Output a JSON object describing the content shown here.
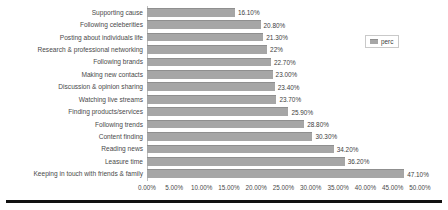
{
  "chart_data": {
    "type": "bar",
    "orientation": "horizontal",
    "title": "",
    "xlabel": "",
    "ylabel": "",
    "xlim": [
      0,
      50
    ],
    "grid": false,
    "legend": {
      "position": "top-right",
      "entries": [
        "perc"
      ]
    },
    "series": [
      {
        "name": "perc",
        "color": "#a6a6a6"
      }
    ],
    "categories": [
      "Supporting cause",
      "Following celeberities",
      "Posting about individuals life",
      "Research & professional networking",
      "Following brands",
      "Making new contacts",
      "Discussion & opinion sharing",
      "Watching live streams",
      "Finding products/services",
      "Following trends",
      "Content finding",
      "Reading news",
      "Leasure time",
      "Keeping in touch with friends & family"
    ],
    "values": [
      16.1,
      20.8,
      21.3,
      22.0,
      22.7,
      23.0,
      23.4,
      23.7,
      25.9,
      28.8,
      30.3,
      34.2,
      36.2,
      47.1
    ],
    "data_labels": [
      "16.10%",
      "20.80%",
      "21.30%",
      "22%",
      "22.70%",
      "23.00%",
      "23.40%",
      "23.70%",
      "25.90%",
      "28.80%",
      "30.30%",
      "34.20%",
      "36.20%",
      "47.10%"
    ],
    "xticks": [
      0,
      5,
      10,
      15,
      20,
      25,
      30,
      35,
      40,
      45,
      50
    ],
    "xticklabels": [
      "0.00%",
      "5.00%",
      "10.00%",
      "15.00%",
      "20.00%",
      "25.00%",
      "30.00%",
      "35.00%",
      "40.00%",
      "45.00%",
      "50.00%"
    ]
  }
}
